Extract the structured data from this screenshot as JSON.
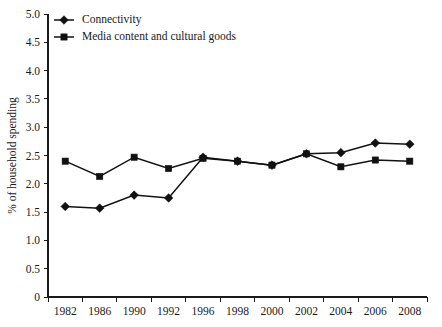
{
  "chart_data": {
    "type": "line",
    "title": "",
    "subtitle": "",
    "xlabel": "",
    "ylabel": "% of household spending",
    "categories": [
      "1982",
      "1986",
      "1990",
      "1992",
      "1996",
      "1998",
      "2000",
      "2002",
      "2004",
      "2006",
      "2008"
    ],
    "ylim": [
      0,
      5.0
    ],
    "ytick_labels": [
      "0",
      "0.5",
      "1.0",
      "1.5",
      "2.0",
      "2.5",
      "3.0",
      "3.5",
      "4.0",
      "4.5",
      "5.0"
    ],
    "ytick_values": [
      0,
      0.5,
      1.0,
      1.5,
      2.0,
      2.5,
      3.0,
      3.5,
      4.0,
      4.5,
      5.0
    ],
    "grid": false,
    "legend_position": "top-left",
    "series": [
      {
        "name": "Connectivity",
        "marker": "diamond",
        "color": "#111111",
        "values": [
          1.6,
          1.57,
          1.8,
          1.75,
          2.47,
          2.4,
          2.33,
          2.53,
          2.55,
          2.72,
          2.7
        ]
      },
      {
        "name": "Media content and cultural goods",
        "marker": "square",
        "color": "#111111",
        "values": [
          2.4,
          2.13,
          2.47,
          2.27,
          2.45,
          2.4,
          2.33,
          2.53,
          2.3,
          2.42,
          2.4
        ]
      }
    ]
  },
  "legend": {
    "items": [
      {
        "label": "Connectivity",
        "marker": "diamond"
      },
      {
        "label": "Media content and cultural goods",
        "marker": "square"
      }
    ]
  },
  "axes": {
    "y_title": "% of household spending"
  }
}
